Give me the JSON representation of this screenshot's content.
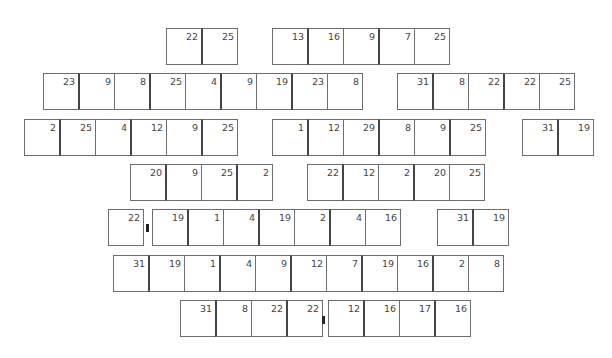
{
  "rows": [
    {
      "groups": [
        {
          "x": 166,
          "y": 28,
          "values": [
            22,
            25
          ]
        },
        {
          "x": 272,
          "y": 28,
          "values": [
            13,
            16,
            9,
            7,
            25
          ]
        }
      ]
    },
    {
      "groups": [
        {
          "x": 43,
          "y": 73,
          "values": [
            23,
            9,
            8,
            25,
            4,
            9,
            19,
            23,
            8
          ]
        },
        {
          "x": 397,
          "y": 73,
          "values": [
            31,
            8,
            22,
            22,
            25
          ]
        }
      ]
    },
    {
      "groups": [
        {
          "x": 24,
          "y": 119,
          "values": [
            2,
            25,
            4,
            12,
            9,
            25
          ]
        },
        {
          "x": 272,
          "y": 119,
          "values": [
            1,
            12,
            29,
            8,
            9,
            25
          ]
        },
        {
          "x": 522,
          "y": 119,
          "values": [
            31,
            19
          ]
        }
      ]
    },
    {
      "groups": [
        {
          "x": 130,
          "y": 164,
          "values": [
            20,
            9,
            25,
            2
          ]
        },
        {
          "x": 307,
          "y": 164,
          "values": [
            22,
            12,
            2,
            20,
            25
          ]
        }
      ]
    },
    {
      "groups": [
        {
          "x": 108,
          "y": 209,
          "values": [
            22
          ]
        },
        {
          "x": 152,
          "y": 209,
          "values": [
            19,
            1,
            4,
            19,
            2,
            4,
            16
          ]
        },
        {
          "x": 437,
          "y": 209,
          "values": [
            31,
            19
          ]
        }
      ],
      "markers": [
        {
          "x": 146,
          "y": 224
        }
      ]
    },
    {
      "groups": [
        {
          "x": 113,
          "y": 255,
          "values": [
            31,
            19,
            1,
            4,
            9,
            12,
            7,
            19,
            16,
            2,
            8
          ]
        }
      ]
    },
    {
      "groups": [
        {
          "x": 180,
          "y": 300,
          "values": [
            31,
            8,
            22,
            22
          ]
        },
        {
          "x": 328,
          "y": 300,
          "values": [
            12,
            16,
            17,
            16
          ]
        }
      ],
      "markers": [
        {
          "x": 322,
          "y": 316
        }
      ]
    }
  ]
}
